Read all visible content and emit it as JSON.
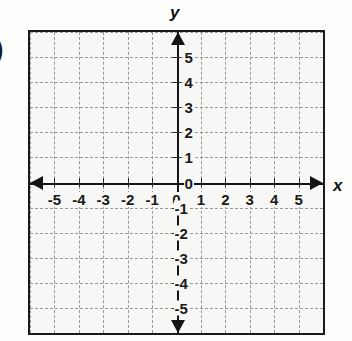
{
  "figure": {
    "cut_off_label": ")",
    "x_axis_name": "x",
    "y_axis_name": "y"
  },
  "chart_data": {
    "type": "scatter",
    "title": "",
    "subtitle": "",
    "xlabel": "x",
    "ylabel": "y",
    "series": [],
    "x": [],
    "values": [],
    "annotations": [],
    "xlim": [
      -6,
      6
    ],
    "ylim": [
      -6,
      6
    ],
    "xticks": [
      -5,
      -4,
      -3,
      -2,
      -1,
      0,
      1,
      2,
      3,
      4,
      5
    ],
    "yticks": [
      5,
      4,
      3,
      2,
      1,
      0,
      -1,
      -2,
      -3,
      -4,
      -5
    ],
    "xtick_labels": [
      "-5",
      "-4",
      "-3",
      "-2",
      "-1",
      "0",
      "1",
      "2",
      "3",
      "4",
      "5"
    ],
    "ytick_labels": [
      "5",
      "4",
      "3",
      "2",
      "1",
      "0",
      "-1",
      "-2",
      "-3",
      "-4",
      "-5"
    ],
    "grid": true,
    "grid_style": "dashed",
    "grid_spacing": 1,
    "legend": null,
    "legend_position": "none",
    "axis_arrows": [
      "left",
      "right",
      "up",
      "down"
    ],
    "colors": {
      "background": "#f7f7f5",
      "grid": "#9a9a9a",
      "axis": "#141414",
      "border": "#1b1b1b",
      "text": "#1a1a1a"
    }
  }
}
